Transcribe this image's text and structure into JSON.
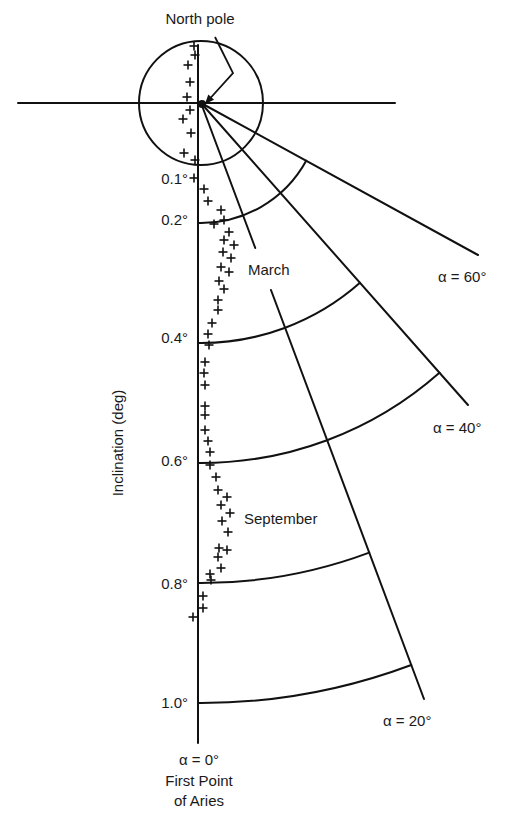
{
  "figure": {
    "pole_label": "North pole",
    "y_axis_title": "Inclination (deg)",
    "origin_labels": [
      "α = 0°",
      "First Point",
      "of Aries"
    ],
    "series_labels": {
      "march": "March",
      "september": "September"
    },
    "colors": {
      "ink": "#111111",
      "background": "#ffffff"
    }
  },
  "chart_data": {
    "type": "scatter",
    "title": "",
    "coordinate_system": "polar",
    "radial_label": "Inclination (deg)",
    "radial_ticks": [
      "0.1°",
      "0.2°",
      "0.4°",
      "0.6°",
      "0.8°",
      "1.0°"
    ],
    "radial_tick_values": [
      0.1,
      0.2,
      0.4,
      0.6,
      0.8,
      1.0
    ],
    "angular_label": "α",
    "angular_ticks": [
      "α = 0°",
      "α = 20°",
      "α = 40°",
      "α = 60°"
    ],
    "angular_tick_values": [
      0,
      20,
      40,
      60
    ],
    "annotations": [
      "North pole",
      "March",
      "September",
      "First Point of Aries"
    ],
    "arcs": [
      {
        "r": 0.2,
        "to_alpha": 60
      },
      {
        "r": 0.4,
        "to_alpha": 40
      },
      {
        "r": 0.6,
        "to_alpha": 40
      },
      {
        "r": 0.8,
        "to_alpha": 20
      },
      {
        "r": 1.0,
        "to_alpha": 20
      }
    ],
    "series": [
      {
        "name": "Pole path (pixel positions)",
        "points": [
          [
            194,
            46
          ],
          [
            195,
            55
          ],
          [
            188,
            65
          ],
          [
            190,
            82
          ],
          [
            187,
            97
          ],
          [
            190,
            110
          ],
          [
            183,
            119
          ],
          [
            191,
            133
          ],
          [
            184,
            153
          ],
          [
            195,
            160
          ],
          [
            194,
            178
          ],
          [
            204,
            189
          ],
          [
            208,
            201
          ],
          [
            221,
            210
          ],
          [
            214,
            224
          ],
          [
            224,
            220
          ],
          [
            229,
            232
          ],
          [
            224,
            240
          ],
          [
            234,
            245
          ],
          [
            223,
            252
          ],
          [
            231,
            258
          ],
          [
            221,
            267
          ],
          [
            229,
            272
          ],
          [
            219,
            281
          ],
          [
            224,
            289
          ],
          [
            218,
            300
          ],
          [
            218,
            310
          ],
          [
            212,
            323
          ],
          [
            208,
            334
          ],
          [
            209,
            345
          ],
          [
            205,
            362
          ],
          [
            204,
            373
          ],
          [
            205,
            385
          ],
          [
            205,
            406
          ],
          [
            205,
            415
          ],
          [
            205,
            430
          ],
          [
            208,
            441
          ],
          [
            210,
            452
          ],
          [
            210,
            465
          ],
          [
            216,
            477
          ],
          [
            218,
            490
          ],
          [
            227,
            497
          ],
          [
            221,
            505
          ],
          [
            230,
            513
          ],
          [
            222,
            521
          ],
          [
            228,
            532
          ],
          [
            219,
            548
          ],
          [
            227,
            550
          ],
          [
            218,
            557
          ],
          [
            221,
            568
          ],
          [
            210,
            574
          ],
          [
            211,
            580
          ],
          [
            203,
            596
          ],
          [
            203,
            608
          ],
          [
            193,
            617
          ]
        ]
      }
    ]
  },
  "geometry": {
    "pole": [
      201,
      103
    ],
    "px_per_deg": 600,
    "hline": [
      18,
      395
    ],
    "vline": [
      45,
      743
    ],
    "vline_x": 198,
    "spokes": [
      {
        "alpha": 20,
        "end": [
          424,
          699
        ],
        "gap": [
          248,
          290
        ]
      },
      {
        "alpha": 40,
        "end": [
          468,
          405
        ]
      },
      {
        "alpha": 60,
        "end": [
          478,
          255
        ]
      }
    ],
    "pole_arrow": [
      [
        215,
        37
      ],
      [
        233,
        73
      ],
      [
        205,
        104
      ]
    ]
  },
  "labels": {
    "radial": [
      {
        "text": "0.1°",
        "x": 188,
        "y": 184
      },
      {
        "text": "0.2°",
        "x": 188,
        "y": 225
      },
      {
        "text": "0.4°",
        "x": 188,
        "y": 343
      },
      {
        "text": "0.6°",
        "x": 188,
        "y": 466
      },
      {
        "text": "0.8°",
        "x": 188,
        "y": 589
      },
      {
        "text": "1.0°",
        "x": 188,
        "y": 708
      }
    ],
    "angular": [
      {
        "text": "α = 60°",
        "x": 438,
        "y": 282
      },
      {
        "text": "α = 40°",
        "x": 433,
        "y": 433
      },
      {
        "text": "α = 20°",
        "x": 383,
        "y": 726
      }
    ]
  }
}
